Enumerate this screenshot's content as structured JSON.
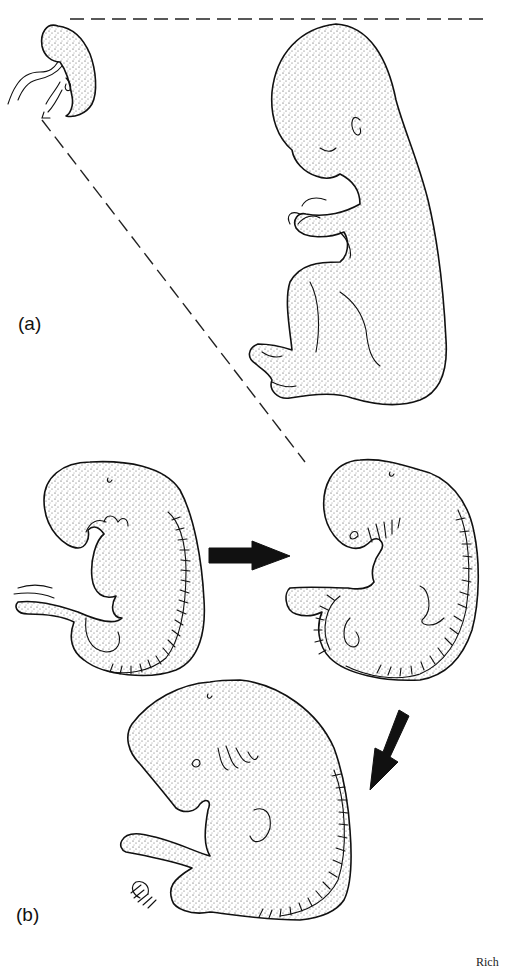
{
  "figure": {
    "panel_labels": {
      "a": "(a)",
      "b": "(b)"
    },
    "credit_text": "Rich",
    "panels": [
      {
        "id": "a",
        "description": "Small early fetus (top left) scaled up to large fetus in fetal position (top right), connected by dashed projection lines",
        "elements": [
          "small-fetus",
          "large-fetus",
          "projection-line-top",
          "projection-line-diagonal"
        ]
      },
      {
        "id": "b",
        "description": "Three embryo stages showing developmental sequence with arrows",
        "elements": [
          "embryo-stage-1",
          "embryo-stage-2",
          "embryo-stage-3"
        ],
        "arrows": [
          {
            "name": "arrow-right",
            "direction": "right",
            "from": "embryo-stage-1",
            "to": "embryo-stage-2"
          },
          {
            "name": "arrow-down-left",
            "direction": "down-left",
            "from": "embryo-stage-2",
            "to": "embryo-stage-3"
          }
        ]
      }
    ],
    "colors": {
      "background": "#ffffff",
      "ink": "#111111"
    }
  }
}
